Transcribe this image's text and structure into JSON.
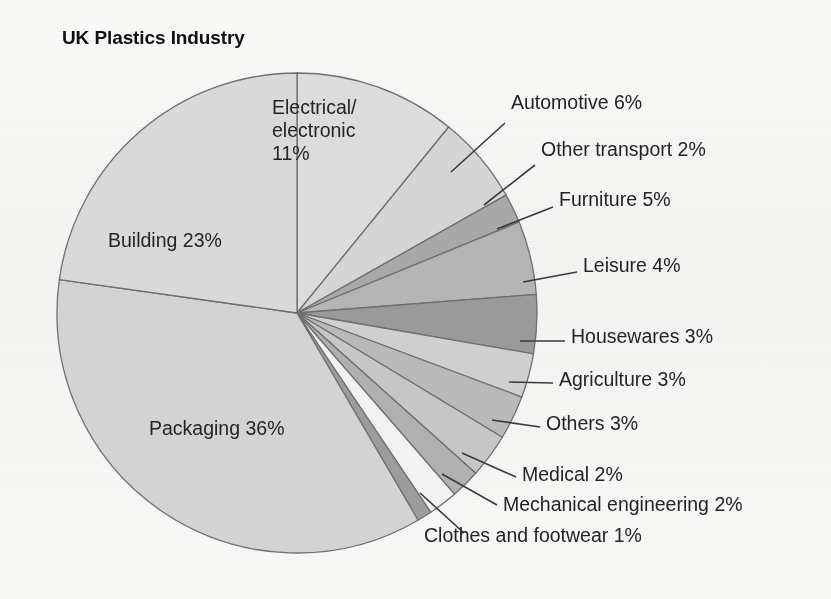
{
  "chart_data": {
    "type": "pie",
    "title": "UK Plastics Industry",
    "unit": "%",
    "start_angle_deg": 0,
    "direction": "clockwise",
    "legend": "none",
    "grid": false,
    "categories": [
      "Electrical/electronic",
      "Automotive",
      "Other transport",
      "Furniture",
      "Leisure",
      "Housewares",
      "Agriculture",
      "Others",
      "Medical",
      "Mechanical engineering",
      "Clothes and footwear",
      "Packaging",
      "Building"
    ],
    "values": [
      11,
      6,
      2,
      5,
      4,
      3,
      3,
      3,
      2,
      2,
      1,
      36,
      23
    ],
    "slices": [
      {
        "label": "Electrical/electronic 11%",
        "name": "Electrical/electronic",
        "value": 11,
        "color": "#dcdcdc",
        "label_mode": "inside"
      },
      {
        "label": "Automotive 6%",
        "name": "Automotive",
        "value": 6,
        "color": "#d5d5d5",
        "label_mode": "callout"
      },
      {
        "label": "Other transport 2%",
        "name": "Other transport",
        "value": 2,
        "color": "#a8a8a8",
        "label_mode": "callout"
      },
      {
        "label": "Furniture 5%",
        "name": "Furniture",
        "value": 5,
        "color": "#b4b4b4",
        "label_mode": "callout"
      },
      {
        "label": "Leisure 4%",
        "name": "Leisure",
        "value": 4,
        "color": "#9a9a9a",
        "label_mode": "callout"
      },
      {
        "label": "Housewares 3%",
        "name": "Housewares",
        "value": 3,
        "color": "#cfcfcf",
        "label_mode": "callout"
      },
      {
        "label": "Agriculture 3%",
        "name": "Agriculture",
        "value": 3,
        "color": "#b9b9b9",
        "label_mode": "callout"
      },
      {
        "label": "Others 3%",
        "name": "Others",
        "value": 3,
        "color": "#c6c6c6",
        "label_mode": "callout"
      },
      {
        "label": "Medical 2%",
        "name": "Medical",
        "value": 2,
        "color": "#b0b0b0",
        "label_mode": "callout"
      },
      {
        "label": "Mechanical engineering 2%",
        "name": "Mechanical engineering",
        "value": 2,
        "color": "#f2f2f2",
        "label_mode": "callout"
      },
      {
        "label": "Clothes and footwear 1%",
        "name": "Clothes and footwear",
        "value": 1,
        "color": "#9c9c9c",
        "label_mode": "callout"
      },
      {
        "label": "Packaging 36%",
        "name": "Packaging",
        "value": 36,
        "color": "#d3d3d3",
        "label_mode": "inside"
      },
      {
        "label": "Building 23%",
        "name": "Building",
        "value": 23,
        "color": "#d9d9d9",
        "label_mode": "inside"
      }
    ],
    "inside_labels": {
      "electrical": "Electrical/\nelectronic\n11%",
      "electrical_line1": "Electrical/",
      "electrical_line2": "electronic",
      "electrical_line3": "11%",
      "building": "Building 23%",
      "packaging": "Packaging 36%"
    },
    "callout_labels": {
      "automotive": "Automotive 6%",
      "other_transport": "Other transport 2%",
      "furniture": "Furniture 5%",
      "leisure": "Leisure 4%",
      "housewares": "Housewares 3%",
      "agriculture": "Agriculture 3%",
      "others": "Others 3%",
      "medical": "Medical 2%",
      "mechanical_engineering": "Mechanical engineering 2%",
      "clothes_and_footwear": "Clothes and footwear 1%"
    },
    "colors": {
      "outline": "#6f6f6f",
      "leader_line": "#3a3a3a",
      "text": "#242424",
      "background": "#fbfbfa"
    },
    "geometry": {
      "center_x": 297,
      "center_y": 313,
      "radius": 240
    }
  }
}
